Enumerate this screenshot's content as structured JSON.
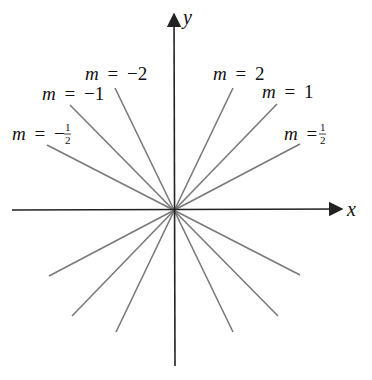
{
  "diagram": {
    "type": "lines-through-origin",
    "axes": {
      "x_label": "x",
      "y_label": "y"
    },
    "colors": {
      "axis": "#222222",
      "line": "#7a7a7a",
      "text": "#111111"
    },
    "origin_px": [
      174,
      210
    ],
    "lines": [
      {
        "slope": "-2",
        "label_var": "m",
        "label_eq": "=",
        "label_val": "−2",
        "upper": [
          115,
          88
        ],
        "lower": [
          233,
          332
        ]
      },
      {
        "slope": "-1",
        "label_var": "m",
        "label_eq": "=",
        "label_val": "−1",
        "upper": [
          70,
          105
        ],
        "lower": [
          278,
          316
        ]
      },
      {
        "slope": "-1/2",
        "label_var": "m",
        "label_eq": "=",
        "label_val": "−",
        "label_frac_num": "1",
        "label_frac_den": "2",
        "upper": [
          47,
          145
        ],
        "lower": [
          300,
          275
        ]
      },
      {
        "slope": "2",
        "label_var": "m",
        "label_eq": "=",
        "label_val": "2",
        "upper": [
          233,
          88
        ],
        "lower": [
          116,
          332
        ]
      },
      {
        "slope": "1",
        "label_var": "m",
        "label_eq": "=",
        "label_val": "1",
        "upper": [
          277,
          104
        ],
        "lower": [
          72,
          316
        ]
      },
      {
        "slope": "1/2",
        "label_var": "m",
        "label_eq": "=",
        "label_val": "",
        "label_frac_num": "1",
        "label_frac_den": "2",
        "upper": [
          300,
          144
        ],
        "lower": [
          49,
          276
        ]
      }
    ]
  }
}
